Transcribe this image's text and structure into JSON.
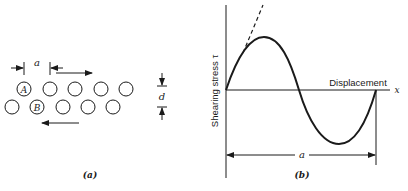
{
  "panel_a": {
    "caption": "(a)",
    "spacing_label": "a",
    "layer_gap_label": "d",
    "atom_labels": {
      "A": "A",
      "B": "B"
    },
    "top_row_count": 5,
    "bottom_row_count": 5,
    "top_arrow_direction": "right",
    "bottom_arrow_direction": "left"
  },
  "panel_b": {
    "caption": "(b)",
    "y_axis_label": "Shearing stress τ",
    "x_axis_label": "Displacement",
    "x_axis_symbol": "x",
    "period_label": "a",
    "curve": "sine",
    "tangent_style": "dashed"
  },
  "colors": {
    "ink": "#1a1a1a",
    "background": "#ffffff"
  }
}
